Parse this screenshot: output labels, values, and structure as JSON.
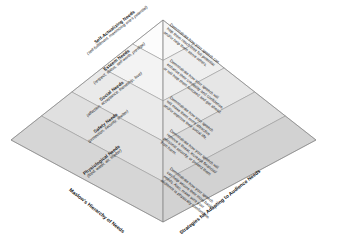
{
  "diagram": {
    "title_left": "Maslow's Hierarchy of Needs",
    "title_right": "Strategies for Adapting to Audience Needs",
    "colors": {
      "left_face_top": "#fdfdfd",
      "left_face_bottom": "#d8d8d8",
      "right_face_top": "#f2f2f2",
      "right_face_bottom": "#cfcfcf",
      "outline": "#8c8c8c",
      "text": "#1a1a1a"
    }
  },
  "tiers": [
    {
      "id": "self-actualizing",
      "name": "Self-Actualizing Needs",
      "sub": "(self-fulfillment, maximizing\none's potential)",
      "strategy": "Demonstrate how your speech can\nhelp them reach their full potential\nand/or help them serve others."
    },
    {
      "id": "esteem",
      "name": "Esteem Needs",
      "sub": "(respect, status,\nself-worth, prestige)",
      "strategy": "Demonstrate how your speech will\nenhance their credibility and confidence,\nor will help them succeed and get ahead."
    },
    {
      "id": "social",
      "name": "Social Needs",
      "sub": "(affection, acceptance,\nfriendship, love)",
      "strategy": "Demonstrate how your speech\nwill make them more attractive\nand/or improve their social life."
    },
    {
      "id": "safety",
      "name": "Safety Needs",
      "sub": "(protection, security, shelter)",
      "strategy": "Demonstrate how your speech will\nremove a threat, increase financial/\npersonal security, or protect them\nfrom harm."
    },
    {
      "id": "physiological",
      "name": "Physiological Needs",
      "sub": "(food, water, air, shelter)",
      "strategy": "Demonstrate how your speech\ncan help secure their most basic\nneeds. Also, make sure your\naudience is physically comfortable."
    }
  ]
}
